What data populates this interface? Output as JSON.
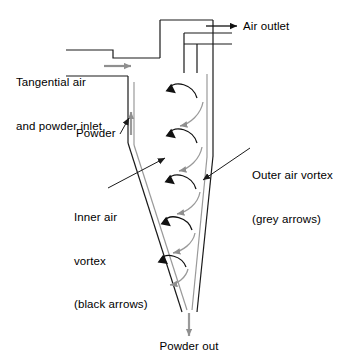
{
  "diagram": {
    "kind": "cyclone-separator-schematic",
    "width": 344,
    "height": 362,
    "background": "#ffffff",
    "colors": {
      "outline": "#1a1a1a",
      "inner_wall": "#9a9a9a",
      "black_arrow": "#111111",
      "grey_arrow": "#9a9a9a",
      "leader": "#1a1a1a",
      "text": "#000000"
    }
  },
  "labels": {
    "air_outlet": "Air outlet",
    "inlet_line1": "Tangential air",
    "inlet_line2": "and powder inlet",
    "powder": "Powder",
    "inner_vortex_line1": "Inner air",
    "inner_vortex_line2": "vortex",
    "inner_vortex_line3": "(black arrows)",
    "outer_vortex_line1": "Outer air vortex",
    "outer_vortex_line2": "(grey arrows)",
    "powder_out": "Powder out"
  },
  "legend": {
    "inner_vortex_arrow_color": "black",
    "outer_vortex_arrow_color": "grey"
  },
  "flows": [
    {
      "name": "tangential-inlet",
      "direction": "right",
      "style": "grey-arrow"
    },
    {
      "name": "air-outlet",
      "direction": "right",
      "style": "black-arrow"
    },
    {
      "name": "powder-wall-flow",
      "direction": "up",
      "style": "grey-arrow"
    },
    {
      "name": "powder-out",
      "direction": "down",
      "style": "grey-arrow"
    },
    {
      "name": "inner-air-vortex",
      "direction": "upward-spiral",
      "style": "black-curved-arrows",
      "count": 5
    },
    {
      "name": "outer-air-vortex",
      "direction": "downward-spiral",
      "style": "grey-curved-arrows",
      "count": 5
    }
  ]
}
